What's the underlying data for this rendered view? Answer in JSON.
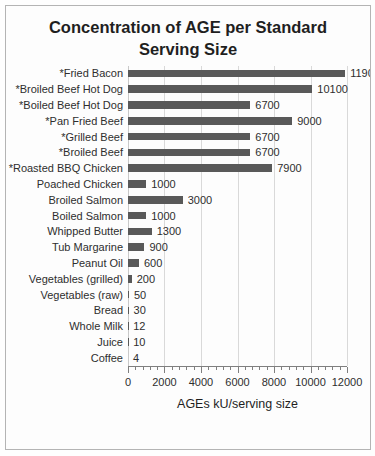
{
  "chart_data": {
    "type": "bar",
    "orientation": "horizontal",
    "title": "Concentration of AGE per Standard Serving Size",
    "xlabel": "AGEs kU/serving size",
    "xlim": [
      0,
      12000
    ],
    "x_ticks": [
      0,
      2000,
      4000,
      6000,
      8000,
      10000,
      12000
    ],
    "minor_tick_interval": 400,
    "grid": "vertical-major",
    "legend": "none",
    "bar_color": "#595959",
    "gridline_color": "#d9d9d9",
    "axis_color": "#7f7f7f",
    "categories": [
      "*Fried Bacon",
      "*Broiled Beef Hot Dog",
      "*Boiled Beef Hot Dog",
      "*Pan Fried Beef",
      "*Grilled Beef",
      "*Broiled Beef",
      "*Roasted BBQ Chicken",
      "Poached Chicken",
      "Broiled Salmon",
      "Boiled Salmon",
      "Whipped Butter",
      "Tub Margarine",
      "Peanut Oil",
      "Vegetables (grilled)",
      "Vegetables (raw)",
      "Bread",
      "Whole Milk",
      "Juice",
      "Coffee"
    ],
    "values": [
      11900,
      10100,
      6700,
      9000,
      6700,
      6700,
      7900,
      1000,
      3000,
      1000,
      1300,
      900,
      600,
      200,
      50,
      30,
      12,
      10,
      4
    ]
  }
}
